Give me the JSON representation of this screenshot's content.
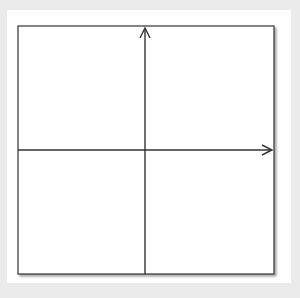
{
  "panel_label": "J",
  "axes": {
    "x_label": "x",
    "y_label": "y",
    "x_ticks": [
      "−5",
      "−4",
      "−3",
      "−2",
      "−1",
      "1",
      "2",
      "3",
      "4",
      "5"
    ],
    "y_ticks_positive": [
      "1",
      "2",
      "3",
      "4",
      "5"
    ],
    "y_ticks_negative": [
      "−1",
      "−2",
      "−3",
      "−4",
      "−5"
    ]
  },
  "colors": {
    "background": "#ebebeb",
    "card": "#ffffff",
    "grid": "#bdbdbd",
    "axis": "#333333",
    "curve": "#1a1a1a"
  },
  "chart_data": {
    "type": "line",
    "function": "y = x^2",
    "xlabel": "x",
    "ylabel": "y",
    "xlim": [
      -6,
      6
    ],
    "ylim": [
      -6,
      6
    ],
    "grid": true,
    "x": [
      -2.4,
      -2,
      -1,
      0,
      1,
      2,
      2.4
    ],
    "series": [
      {
        "name": "y = x^2",
        "values": [
          5.76,
          4,
          1,
          0,
          1,
          4,
          5.76
        ]
      }
    ],
    "arrows_on_ends": true
  }
}
